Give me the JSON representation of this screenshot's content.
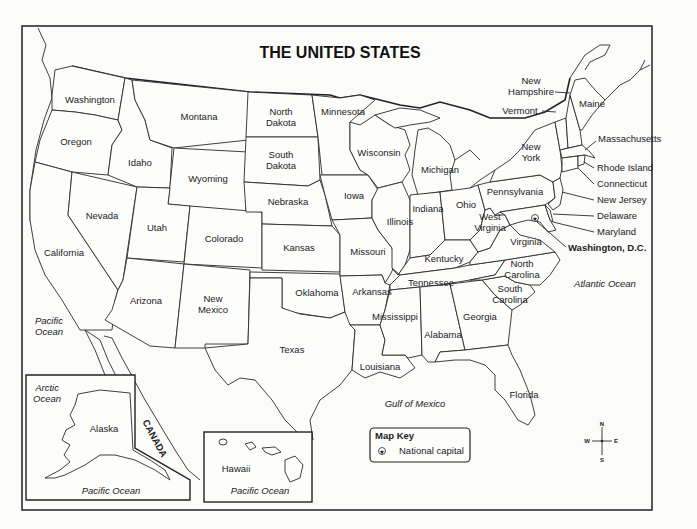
{
  "title": "THE UNITED STATES",
  "states": {
    "washington": "Washington",
    "oregon": "Oregon",
    "california": "California",
    "idaho": "Idaho",
    "nevada": "Nevada",
    "montana": "Montana",
    "wyoming": "Wyoming",
    "utah": "Utah",
    "colorado": "Colorado",
    "arizona": "Arizona",
    "new_mexico_1": "New",
    "new_mexico_2": "Mexico",
    "north_dakota_1": "North",
    "north_dakota_2": "Dakota",
    "south_dakota_1": "South",
    "south_dakota_2": "Dakota",
    "nebraska": "Nebraska",
    "kansas": "Kansas",
    "oklahoma": "Oklahoma",
    "texas": "Texas",
    "minnesota": "Minnesota",
    "iowa": "Iowa",
    "missouri": "Missouri",
    "arkansas": "Arkansas",
    "louisiana": "Louisiana",
    "wisconsin": "Wisconsin",
    "illinois": "Illinois",
    "michigan": "Michigan",
    "indiana": "Indiana",
    "ohio": "Ohio",
    "kentucky": "Kentucky",
    "tennessee": "Tennessee",
    "mississippi": "Mississippi",
    "alabama": "Alabama",
    "georgia": "Georgia",
    "florida": "Florida",
    "south_carolina_1": "South",
    "south_carolina_2": "Carolina",
    "north_carolina_1": "North",
    "north_carolina_2": "Carolina",
    "virginia": "Virginia",
    "west_virginia_1": "West",
    "west_virginia_2": "Virginia",
    "pennsylvania": "Pennsylvania",
    "new_york_1": "New",
    "new_york_2": "York",
    "vermont": "Vermont",
    "new_hampshire_1": "New",
    "new_hampshire_2": "Hampshire",
    "maine": "Maine",
    "massachusetts": "Massachusetts",
    "rhode_island": "Rhode Island",
    "connecticut": "Connecticut",
    "new_jersey": "New Jersey",
    "delaware": "Delaware",
    "maryland": "Maryland",
    "alaska": "Alaska",
    "hawaii": "Hawaii"
  },
  "capital": "Washington, D.C.",
  "water": {
    "pacific_1": "Pacific",
    "pacific_2": "Ocean",
    "atlantic": "Atlantic Ocean",
    "gulf": "Gulf of Mexico",
    "arctic_1": "Arctic",
    "arctic_2": "Ocean",
    "alaska_pacific": "Pacific Ocean",
    "hawaii_pacific": "Pacific Ocean"
  },
  "other_labels": {
    "canada": "CANADA"
  },
  "map_key": {
    "title": "Map Key",
    "national_capital": "National capital"
  },
  "compass": {
    "n": "N",
    "s": "S",
    "e": "E",
    "w": "W"
  }
}
